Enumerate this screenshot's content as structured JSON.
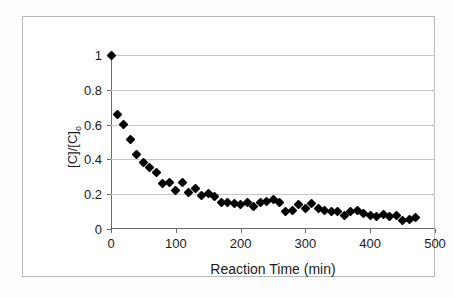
{
  "chart_data": {
    "type": "scatter",
    "title": "",
    "xlabel": "Reaction Time (min)",
    "ylabel": "[C]/[C]o",
    "ylabel_main": "[C]/[C]",
    "ylabel_sub": "o",
    "xlim": [
      0,
      500
    ],
    "ylim": [
      0,
      1
    ],
    "xticks": [
      0,
      100,
      200,
      300,
      400,
      500
    ],
    "yticks": [
      0,
      0.2,
      0.4,
      0.6,
      0.8,
      1
    ],
    "xtick_labels": [
      "0",
      "100",
      "200",
      "300",
      "400",
      "500"
    ],
    "ytick_labels": [
      "0",
      "0.2",
      "0.4",
      "0.6",
      "0.8",
      "1"
    ],
    "grid": "horizontal",
    "legend": "none",
    "marker": "filled-diamond",
    "marker_color": "#000000",
    "series": [
      {
        "name": "[C]/[C]o vs Reaction Time",
        "x": [
          0,
          10,
          20,
          30,
          40,
          50,
          60,
          70,
          80,
          90,
          100,
          110,
          120,
          130,
          140,
          150,
          160,
          170,
          180,
          190,
          200,
          210,
          220,
          230,
          240,
          250,
          260,
          270,
          280,
          290,
          300,
          310,
          320,
          330,
          340,
          350,
          360,
          370,
          380,
          390,
          400,
          410,
          420,
          430,
          440,
          450,
          460,
          470
        ],
        "y": [
          1.0,
          0.66,
          0.6,
          0.515,
          0.43,
          0.385,
          0.355,
          0.325,
          0.26,
          0.265,
          0.22,
          0.27,
          0.21,
          0.235,
          0.19,
          0.205,
          0.185,
          0.155,
          0.15,
          0.145,
          0.14,
          0.155,
          0.13,
          0.155,
          0.16,
          0.17,
          0.15,
          0.1,
          0.105,
          0.14,
          0.115,
          0.145,
          0.12,
          0.105,
          0.1,
          0.1,
          0.08,
          0.1,
          0.105,
          0.09,
          0.075,
          0.07,
          0.085,
          0.07,
          0.075,
          0.05,
          0.055,
          0.065
        ]
      }
    ]
  },
  "figure": {
    "y_axis_title": "[C]/[C]o",
    "x_axis_title": "Reaction Time (min)"
  }
}
